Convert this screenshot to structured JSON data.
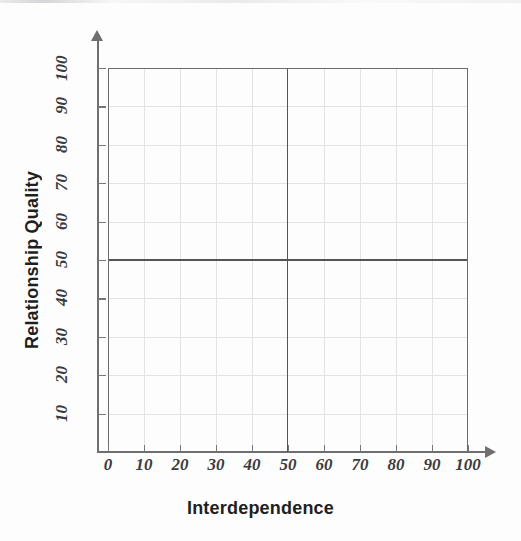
{
  "figure": {
    "background_color": "#fdfdfd",
    "plot_border_color": "#6b6b6b",
    "gridline_color": "#e3e3e5",
    "quadrant_line_color": "#555558",
    "axis_color": "#6f6f72",
    "label_color": "#3b3b3d",
    "title_color": "#1f1f21"
  },
  "chart_data": {
    "type": "scatter",
    "title": "",
    "subtitle": "",
    "xlabel": "Interdependence",
    "ylabel": "Relationship Quality",
    "xlim": [
      0,
      100
    ],
    "ylim": [
      0,
      100
    ],
    "xticks": [
      0,
      10,
      20,
      30,
      40,
      50,
      60,
      70,
      80,
      90,
      100
    ],
    "yticks": [
      10,
      20,
      30,
      40,
      50,
      60,
      70,
      80,
      90,
      100
    ],
    "xticklabels": [
      "0",
      "10",
      "20",
      "30",
      "40",
      "50",
      "60",
      "70",
      "80",
      "90",
      "100"
    ],
    "yticklabels": [
      "10",
      "20",
      "30",
      "40",
      "50",
      "60",
      "70",
      "80",
      "90",
      "100"
    ],
    "grid": true,
    "grid_interval": 10,
    "legend": null,
    "legend_position": "none",
    "series": [],
    "values": [],
    "x": [],
    "annotations": [],
    "quadrant_lines": {
      "vertical_x": 50,
      "horizontal_y": 50
    }
  },
  "axes": {
    "x": {
      "title": "Interdependence",
      "ticks": [
        "0",
        "10",
        "20",
        "30",
        "40",
        "50",
        "60",
        "70",
        "80",
        "90",
        "100"
      ],
      "has_arrow": true
    },
    "y": {
      "title": "Relationship Quality",
      "ticks": [
        "10",
        "20",
        "30",
        "40",
        "50",
        "60",
        "70",
        "80",
        "90",
        "100"
      ],
      "has_arrow": true
    }
  }
}
